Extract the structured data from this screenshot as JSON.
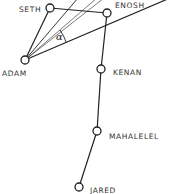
{
  "diagram": {
    "nodes": [
      {
        "id": "seth",
        "label": "SETH",
        "x": 50,
        "y": 8,
        "lx": 17,
        "ly": 12
      },
      {
        "id": "enosh",
        "label": "ENOSH",
        "x": 107,
        "y": 13,
        "lx": 115,
        "ly": 7
      },
      {
        "id": "adam",
        "label": "ADAM",
        "x": 25,
        "y": 60,
        "lx": 2,
        "ly": 76
      },
      {
        "id": "kenan",
        "label": "KENAN",
        "x": 101,
        "y": 69,
        "lx": 113,
        "ly": 75
      },
      {
        "id": "mahalelel",
        "label": "MAHALELEL",
        "x": 97,
        "y": 131,
        "lx": 109,
        "ly": 137
      },
      {
        "id": "jared",
        "label": "JARED",
        "x": 79,
        "y": 187,
        "lx": 90,
        "ly": 194
      }
    ],
    "edges": [
      [
        "adam",
        "seth"
      ],
      [
        "seth",
        "enosh"
      ],
      [
        "enosh",
        "kenan"
      ],
      [
        "kenan",
        "mahalelel"
      ],
      [
        "mahalelel",
        "jared"
      ]
    ],
    "angle_symbol": "α",
    "line_color": "#222222"
  }
}
